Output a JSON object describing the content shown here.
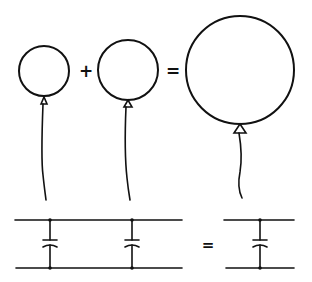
{
  "diagram": {
    "colors": {
      "ink": "#111111",
      "background": "#ffffff"
    },
    "balloon_row": {
      "plus_symbol": "+",
      "equals_symbol": "=",
      "balloons": [
        {
          "name": "small-balloon-1",
          "cx": 44,
          "cy": 71,
          "r": 25
        },
        {
          "name": "small-balloon-2",
          "cx": 128,
          "cy": 70,
          "r": 30
        },
        {
          "name": "large-balloon",
          "cx": 240,
          "cy": 70,
          "r": 54
        }
      ]
    },
    "circuit_row": {
      "equals_symbol": "=",
      "left_circuit": {
        "capacitors": 2,
        "topology": "parallel"
      },
      "right_circuit": {
        "capacitors": 1,
        "topology": "equivalent"
      }
    }
  }
}
